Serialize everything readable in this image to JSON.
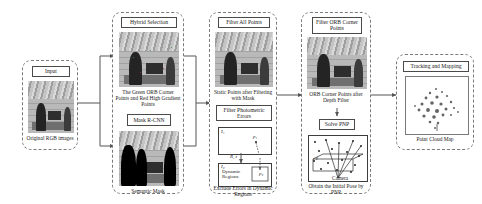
{
  "figure": {
    "kind": "pipeline-diagram"
  },
  "stages": [
    {
      "id": "input",
      "title": "Input",
      "caption": "Original RGB images"
    },
    {
      "id": "hybrid-selection",
      "title": "Hybrid Selection",
      "caption_top": "The Green ORB Corner Points and Red High Gradient Points",
      "box_label": "Mask  R-CNN",
      "caption_bottom": "Semantic Mask"
    },
    {
      "id": "filter-all-points",
      "title": "Filter All Points",
      "caption_top": "Static Points after Filtering with Mask",
      "box_label": "Filter Photometric Errors",
      "caption_bottom": "Exclude Errors in Dynamic Regions",
      "geometry": {
        "frame_left": "I₁",
        "frame_right": "I₂",
        "point_left": "p₁",
        "point_right": "p₂",
        "motion": "R, t",
        "region_label": "Dynamic Regions"
      }
    },
    {
      "id": "filter-orb-corner-points",
      "title": "Filter ORB Corner Points",
      "caption_top": "ORB Corner Points after Depth Filter",
      "box_label": "Solve PNP",
      "caption_bottom": "Obtain the Initial Pose by PNP",
      "geometry": {
        "camera_label": "Camera",
        "plane_label": "I"
      }
    },
    {
      "id": "tracking-and-mapping",
      "title": "Tracking and Mapping",
      "caption": "Point Cloud Map"
    }
  ],
  "colors": {
    "panel_border": "#7a7a7a",
    "box_border": "#4a4a4a",
    "arrow": "#555555",
    "text": "#1a1a1a"
  }
}
